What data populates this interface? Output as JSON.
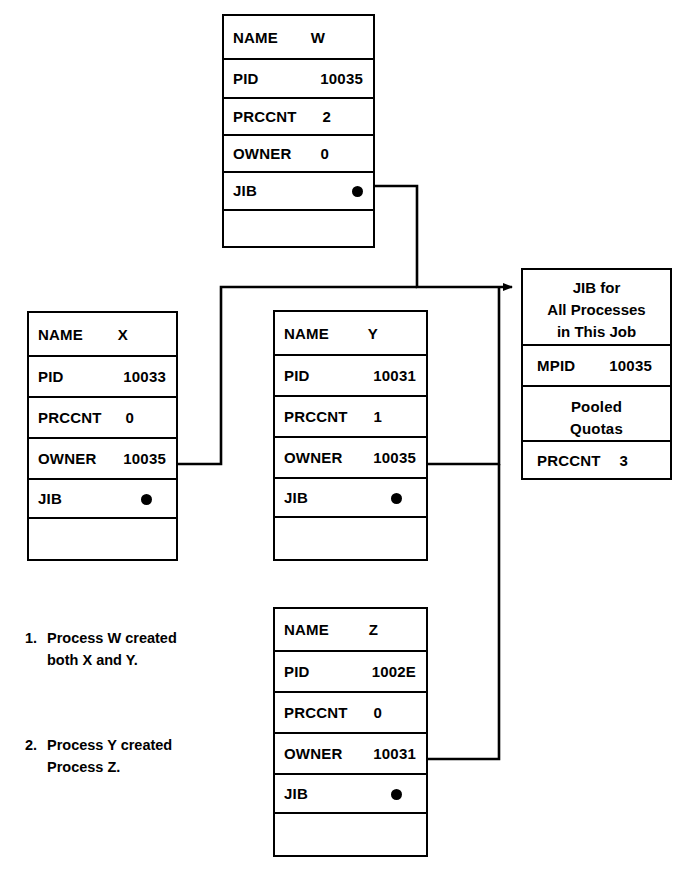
{
  "diagram": {
    "ink_color": "#000000",
    "background_color": "#ffffff"
  },
  "process_boxes": [
    {
      "id": "W",
      "rows": [
        {
          "key": "NAME",
          "value": "W"
        },
        {
          "key": "PID",
          "value": "10035"
        },
        {
          "key": "PRCCNT",
          "value": "2"
        },
        {
          "key": "OWNER",
          "value": "0"
        },
        {
          "key": "JIB",
          "value": ""
        }
      ]
    },
    {
      "id": "X",
      "rows": [
        {
          "key": "NAME",
          "value": "X"
        },
        {
          "key": "PID",
          "value": "10033"
        },
        {
          "key": "PRCCNT",
          "value": "0"
        },
        {
          "key": "OWNER",
          "value": "10035"
        },
        {
          "key": "JIB",
          "value": ""
        }
      ]
    },
    {
      "id": "Y",
      "rows": [
        {
          "key": "NAME",
          "value": "Y"
        },
        {
          "key": "PID",
          "value": "10031"
        },
        {
          "key": "PRCCNT",
          "value": "1"
        },
        {
          "key": "OWNER",
          "value": "10035"
        },
        {
          "key": "JIB",
          "value": ""
        }
      ]
    },
    {
      "id": "Z",
      "rows": [
        {
          "key": "NAME",
          "value": "Z"
        },
        {
          "key": "PID",
          "value": "1002E"
        },
        {
          "key": "PRCCNT",
          "value": "0"
        },
        {
          "key": "OWNER",
          "value": "10031"
        },
        {
          "key": "JIB",
          "value": ""
        }
      ]
    }
  ],
  "jib_box": {
    "header_line1": "JIB for",
    "header_line2": "All Processes",
    "header_line3": "in This Job",
    "mpid_key": "MPID",
    "mpid_value": "10035",
    "pooled_line1": "Pooled",
    "pooled_line2": "Quotas",
    "prccnt_key": "PRCCNT",
    "prccnt_value": "3"
  },
  "notes": [
    {
      "number": "1.",
      "text": "Process W created\nboth X and Y."
    },
    {
      "number": "2.",
      "text": "Process Y created\nProcess Z."
    }
  ]
}
